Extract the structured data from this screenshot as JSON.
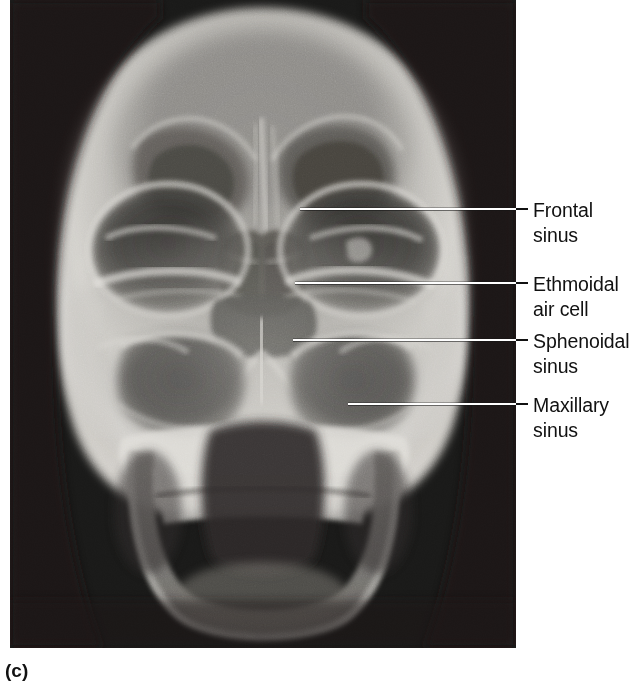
{
  "figure": {
    "panel_caption": "(c)",
    "modality": "radiograph",
    "view": "anteroposterior skull radiograph showing the paranasal sinuses",
    "plate": {
      "x": 10,
      "y": 0,
      "width": 506,
      "height": 648,
      "background_color": "#161616"
    }
  },
  "colors": {
    "page_background": "#ffffff",
    "text": "#111111",
    "leader_line_on_film": "#ffffff",
    "leader_line_on_page": "#111111",
    "film_dark": "#161616",
    "bone_bright": "#e8e6e2",
    "soft_tissue": "#8d8b88",
    "sinus_air": "#3a3936"
  },
  "annotations": [
    {
      "id": "frontal-sinus",
      "lines": [
        "Frontal",
        "sinus"
      ],
      "label_x": 533,
      "label_y": 198,
      "leader": {
        "x1": 300,
        "y1": 209,
        "x2": 527,
        "y2": 209
      }
    },
    {
      "id": "ethmoidal-air-cell",
      "lines": [
        "Ethmoidal",
        "air cell"
      ],
      "label_x": 533,
      "label_y": 272,
      "leader": {
        "x1": 295,
        "y1": 283,
        "x2": 527,
        "y2": 283
      }
    },
    {
      "id": "sphenoidal-sinus",
      "lines": [
        "Sphenoidal",
        "sinus"
      ],
      "label_x": 533,
      "label_y": 329,
      "leader": {
        "x1": 293,
        "y1": 340,
        "x2": 527,
        "y2": 340
      }
    },
    {
      "id": "maxillary-sinus",
      "lines": [
        "Maxillary",
        "sinus"
      ],
      "label_x": 533,
      "label_y": 393,
      "leader": {
        "x1": 348,
        "y1": 404,
        "x2": 527,
        "y2": 404
      }
    }
  ]
}
